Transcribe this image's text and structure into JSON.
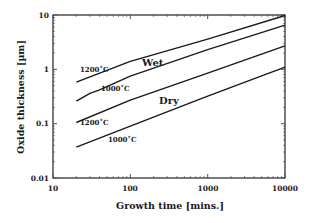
{
  "chart_data": {
    "type": "line",
    "title": "",
    "xlabel": "Growth time [mins.]",
    "ylabel": "Oxide thickness [µm]",
    "xscale": "log",
    "yscale": "log",
    "xlim": [
      10,
      10000
    ],
    "ylim": [
      0.01,
      10
    ],
    "xticks": [
      "10",
      "100",
      "1000",
      "10000"
    ],
    "yticks": [
      "0.01",
      "0.1",
      "1",
      "10"
    ],
    "grid": false,
    "legend": "none",
    "series": [
      {
        "name": "Wet 1200°C",
        "label": "1200˚C",
        "x": [
          20,
          100,
          1000,
          10000
        ],
        "y": [
          0.58,
          1.4,
          3.6,
          9.8
        ]
      },
      {
        "name": "Wet 1000°C",
        "label": "1000˚C",
        "x": [
          20,
          30,
          40,
          100,
          1000,
          10000
        ],
        "y": [
          0.26,
          0.36,
          0.42,
          0.75,
          2.3,
          6.5
        ]
      },
      {
        "name": "Dry 1200°C",
        "label": "1200˚C",
        "x": [
          20,
          100,
          1000,
          10000
        ],
        "y": [
          0.105,
          0.27,
          0.85,
          2.7
        ]
      },
      {
        "name": "Dry 1000°C",
        "label": "1000˚C",
        "x": [
          20,
          100,
          1000,
          10000
        ],
        "y": [
          0.037,
          0.09,
          0.32,
          1.1
        ]
      }
    ],
    "annotations": [
      {
        "text": "Wet",
        "x": 150,
        "y": 1.1
      },
      {
        "text": "Dry",
        "x": 200,
        "y": 0.2
      }
    ]
  }
}
